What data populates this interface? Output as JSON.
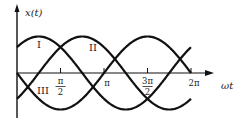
{
  "diagram": {
    "type": "three-phase sinusoids",
    "y_axis_label": "x(t)",
    "x_axis_label": "ωt",
    "ticks": [
      {
        "num": "π",
        "den": "2",
        "pos": 0.25
      },
      {
        "num": "π",
        "den": "",
        "pos": 0.5
      },
      {
        "num": "3π",
        "den": "2",
        "pos": 0.75
      },
      {
        "num": "2π",
        "den": "",
        "pos": 1.0
      }
    ],
    "curves": [
      {
        "label": "I",
        "phase_deg": 45,
        "sign": 1
      },
      {
        "label": "II",
        "phase_deg": -45,
        "sign": 1
      },
      {
        "label": "III",
        "phase_deg": 0,
        "sign": -1
      }
    ],
    "line_color": "#111111"
  },
  "chart_data": {
    "type": "line",
    "title": "",
    "xlabel": "ωt",
    "ylabel": "x(t)",
    "x_ticks": [
      "π/2",
      "π",
      "3π/2",
      "2π"
    ],
    "xlim": [
      0,
      6.2832
    ],
    "ylim": [
      -1,
      1
    ],
    "grid": false,
    "series": [
      {
        "name": "I",
        "formula": "sin(ωt + π/4)"
      },
      {
        "name": "II",
        "formula": "sin(ωt − π/4)"
      },
      {
        "name": "III",
        "formula": "−sin(ωt)"
      }
    ]
  }
}
